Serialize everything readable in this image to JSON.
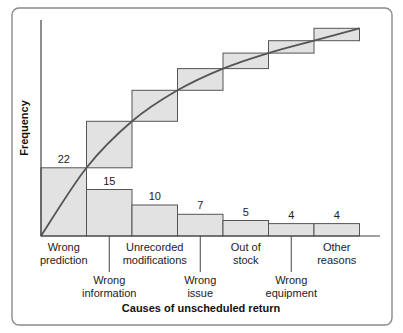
{
  "chart_data": {
    "type": "bar",
    "subtype": "pareto",
    "title": "",
    "xlabel": "Causes of unscheduled return",
    "ylabel": "Frequency",
    "categories": [
      "Wrong prediction",
      "Wrong information",
      "Unrecorded modifications",
      "Wrong issue",
      "Out of stock",
      "Wrong equipment",
      "Other reasons"
    ],
    "category_lines": [
      [
        "Wrong",
        "prediction"
      ],
      [
        "Wrong",
        "information"
      ],
      [
        "Unrecorded",
        "modifications"
      ],
      [
        "Wrong",
        "issue"
      ],
      [
        "Out of",
        "stock"
      ],
      [
        "Wrong",
        "equipment"
      ],
      [
        "Other",
        "reasons"
      ]
    ],
    "label_rows": [
      "top",
      "bottom",
      "top",
      "bottom",
      "top",
      "bottom",
      "top"
    ],
    "values": [
      22,
      15,
      10,
      7,
      5,
      4,
      4
    ],
    "series": [
      {
        "name": "Frequency",
        "type": "bar",
        "values": [
          22,
          15,
          10,
          7,
          5,
          4,
          4
        ]
      },
      {
        "name": "Cumulative frequency",
        "type": "step+curve",
        "values": [
          22,
          37,
          47,
          54,
          59,
          63,
          67
        ]
      }
    ],
    "ylim": [
      0,
      70
    ],
    "grid": false,
    "legend": null,
    "data_labels": true
  },
  "colors": {
    "bar_fill": "#e2e2e2",
    "bar_stroke": "#555555",
    "curve": "#555555",
    "frame": "#8a8a8a"
  }
}
